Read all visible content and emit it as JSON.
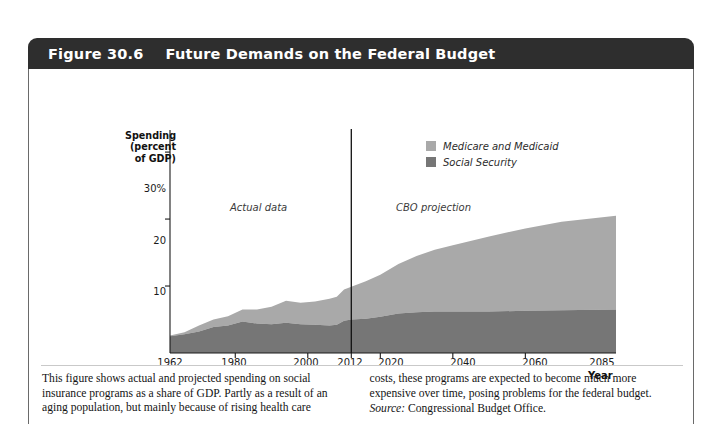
{
  "figure": {
    "number": "Figure 30.6",
    "title": "Future Demands on the Federal Budget"
  },
  "chart_data": {
    "type": "area",
    "stacked": true,
    "title": "Future Demands on the Federal Budget",
    "xlabel": "Year",
    "ylabel": "Spending (percent of GDP)",
    "ylabel_lines": [
      "Spending",
      "(percent",
      "of GDP)"
    ],
    "xlim": [
      1962,
      2085
    ],
    "ylim": [
      0,
      33
    ],
    "grid": false,
    "legend_position": "top-right",
    "ytick_labels": [
      "30%",
      "20",
      "10"
    ],
    "ytick_values": [
      30,
      20,
      10
    ],
    "xtick_labels": [
      "1962",
      "1980",
      "2000",
      "2012",
      "2020",
      "2040",
      "2060",
      "2085"
    ],
    "xtick_values": [
      1962,
      1980,
      2000,
      2012,
      2020,
      2040,
      2060,
      2085
    ],
    "annotations": [
      {
        "text": "Actual data",
        "x": 1985
      },
      {
        "text": "CBO projection",
        "x": 2035
      }
    ],
    "divider_year": 2012,
    "series": [
      {
        "name": "Social Security",
        "color": "#767676",
        "x": [
          1962,
          1966,
          1970,
          1974,
          1978,
          1982,
          1986,
          1990,
          1994,
          1998,
          2002,
          2006,
          2008,
          2010,
          2012,
          2016,
          2020,
          2025,
          2030,
          2035,
          2040,
          2050,
          2060,
          2070,
          2085
        ],
        "values": [
          2.5,
          2.8,
          3.2,
          3.9,
          4.1,
          4.7,
          4.4,
          4.3,
          4.5,
          4.3,
          4.2,
          4.1,
          4.2,
          4.8,
          5.0,
          5.1,
          5.4,
          5.9,
          6.1,
          6.2,
          6.2,
          6.2,
          6.3,
          6.4,
          6.5
        ]
      },
      {
        "name": "Medicare and Medicaid",
        "color": "#a9a9a9",
        "x": [
          1962,
          1966,
          1970,
          1974,
          1978,
          1982,
          1986,
          1990,
          1994,
          1998,
          2002,
          2006,
          2008,
          2010,
          2012,
          2016,
          2020,
          2025,
          2030,
          2035,
          2040,
          2050,
          2060,
          2070,
          2085
        ],
        "values": [
          0.1,
          0.3,
          0.9,
          1.1,
          1.4,
          1.8,
          2.1,
          2.6,
          3.3,
          3.2,
          3.5,
          4.0,
          4.2,
          4.7,
          4.9,
          5.6,
          6.3,
          7.4,
          8.4,
          9.2,
          9.9,
          11.2,
          12.3,
          13.2,
          14.0
        ]
      }
    ],
    "legend": [
      {
        "label": "Medicare and Medicaid",
        "color": "#a9a9a9"
      },
      {
        "label": "Social Security",
        "color": "#767676"
      }
    ]
  },
  "caption": {
    "left": "This figure shows actual and projected spending on social insurance programs as a share of GDP. Partly as a result of an aging population, but mainly because of rising health care",
    "right": "costs, these programs are expected to become much more expensive over time, posing problems for the federal budget.",
    "source_label": "Source:",
    "source_text": " Congressional Budget Office."
  }
}
